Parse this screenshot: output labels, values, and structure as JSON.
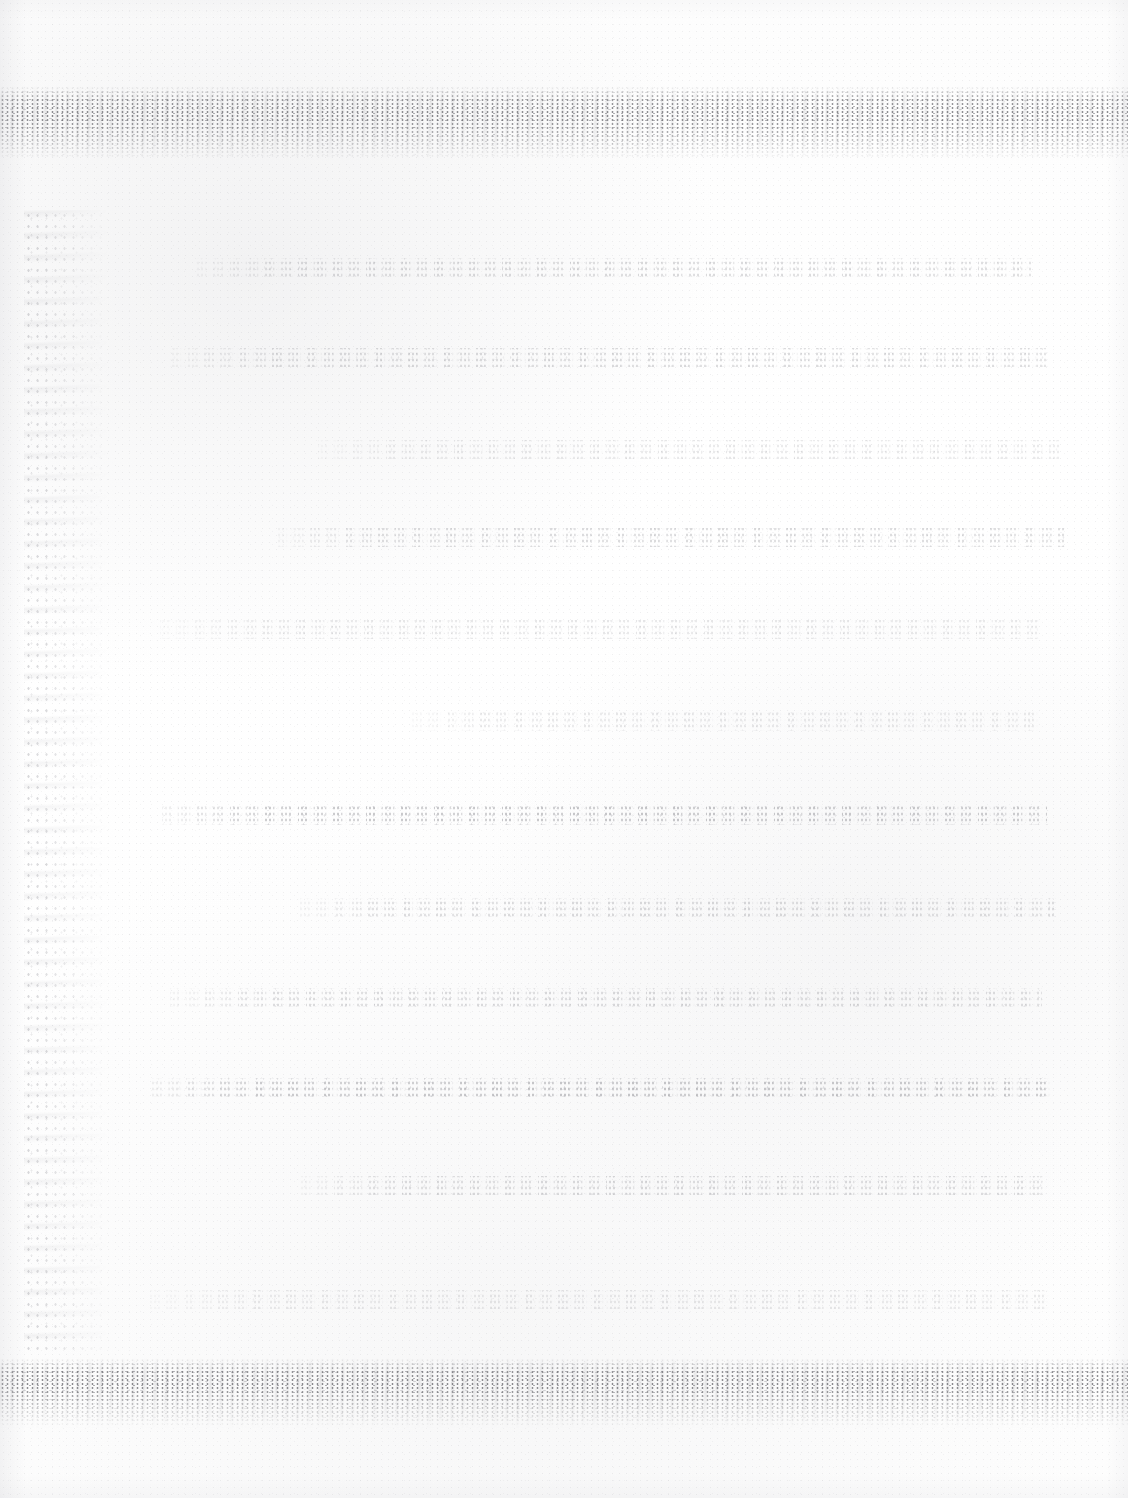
{
  "document": {
    "kind": "scanned-page",
    "condition": "severely-degraded",
    "legible_text": "none",
    "page_width": 1128,
    "page_height": 1498,
    "paper_color": "#fefefe",
    "ink_residue_color": "#606068",
    "band_color": "#5c5c62",
    "description": "Near-blank scanned sheet; all body text has faded to illegible speckled residue."
  },
  "artifacts": {
    "top_band": {
      "label": "top-edge-speckle-band",
      "top": 86,
      "height": 74
    },
    "bottom_band": {
      "label": "bottom-edge-speckle-band",
      "top": 1358,
      "height": 70
    },
    "left_smudge": {
      "label": "left-margin-vertical-smudge",
      "left": 24,
      "top": 210,
      "width": 86,
      "height": 1140
    }
  },
  "text_lines": [
    {
      "id": "line-01",
      "top": 258,
      "left": 196,
      "width": 836,
      "intensity": "normal"
    },
    {
      "id": "line-02",
      "top": 348,
      "left": 170,
      "width": 878,
      "intensity": "normal"
    },
    {
      "id": "line-03",
      "top": 440,
      "left": 318,
      "width": 742,
      "intensity": "faint"
    },
    {
      "id": "line-04",
      "top": 528,
      "left": 276,
      "width": 790,
      "intensity": "normal"
    },
    {
      "id": "line-05",
      "top": 620,
      "left": 160,
      "width": 880,
      "intensity": "faint"
    },
    {
      "id": "line-06",
      "top": 712,
      "left": 412,
      "width": 628,
      "intensity": "faint"
    },
    {
      "id": "line-07",
      "top": 806,
      "left": 162,
      "width": 886,
      "intensity": "strong"
    },
    {
      "id": "line-08",
      "top": 898,
      "left": 300,
      "width": 756,
      "intensity": "normal"
    },
    {
      "id": "line-09",
      "top": 988,
      "left": 170,
      "width": 872,
      "intensity": "normal"
    },
    {
      "id": "line-10",
      "top": 1078,
      "left": 152,
      "width": 900,
      "intensity": "strong"
    },
    {
      "id": "line-11",
      "top": 1176,
      "left": 300,
      "width": 748,
      "intensity": "normal"
    },
    {
      "id": "line-12",
      "top": 1290,
      "left": 150,
      "width": 898,
      "intensity": "faint"
    }
  ]
}
